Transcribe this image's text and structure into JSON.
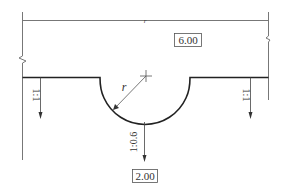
{
  "diagram": {
    "type": "cross-section",
    "colors": {
      "line": "#333333",
      "thin_line": "#777777",
      "background": "#ffffff"
    },
    "dimension_top": {
      "label": "r",
      "note": "overall width dimension"
    },
    "elevation_top": {
      "label": "6.00"
    },
    "elevation_bottom": {
      "label": "2.00"
    },
    "radius_label": "r",
    "slopes": {
      "left": "1:1",
      "right": "1:1",
      "center": "1:0.6"
    }
  }
}
